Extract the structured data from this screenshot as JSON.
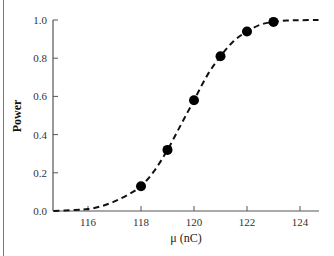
{
  "chart_data": {
    "type": "line",
    "title": "",
    "xlabel": "μ (nC)",
    "ylabel": "Power",
    "xlim": [
      114.7,
      124.7
    ],
    "ylim": [
      0.0,
      1.0
    ],
    "x_ticks": [
      116,
      118,
      120,
      122,
      124
    ],
    "x_tick_labels": [
      "116",
      "118",
      "120",
      "122",
      "124"
    ],
    "y_ticks": [
      0.0,
      0.2,
      0.4,
      0.6,
      0.8,
      1.0
    ],
    "y_tick_labels": [
      "0.0",
      "0.2",
      "0.4",
      "0.6",
      "0.8",
      "1.0"
    ],
    "grid": false,
    "legend": null,
    "series": [
      {
        "name": "power curve",
        "style": "dashed",
        "x": [
          114.7,
          115.5,
          116,
          116.5,
          117,
          117.5,
          118,
          118.5,
          119,
          119.5,
          120,
          120.5,
          121,
          121.5,
          122,
          122.5,
          123,
          123.5,
          124,
          124.7
        ],
        "values": [
          0.0,
          0.005,
          0.01,
          0.025,
          0.05,
          0.085,
          0.13,
          0.21,
          0.32,
          0.45,
          0.58,
          0.71,
          0.81,
          0.89,
          0.94,
          0.975,
          0.99,
          0.997,
          0.999,
          1.0
        ]
      },
      {
        "name": "simulated points",
        "style": "markers",
        "x": [
          118,
          119,
          120,
          121,
          122,
          123
        ],
        "values": [
          0.13,
          0.32,
          0.58,
          0.81,
          0.94,
          0.99
        ]
      }
    ]
  }
}
